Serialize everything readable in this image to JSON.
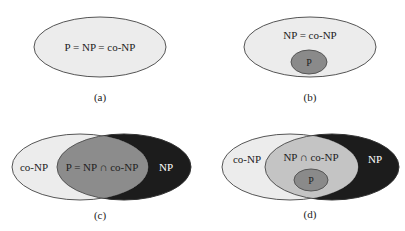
{
  "colors": {
    "background": "#ffffff",
    "light_fill": "#ececec",
    "mid_fill": "#8c8c8c",
    "inner_light_fill": "#c4c4c4",
    "dark_fill": "#1c1c1c",
    "p_fill": "#8a8a8a",
    "stroke": "#555555",
    "text": "#222222",
    "text_on_dark": "#ffffff"
  },
  "panels": [
    {
      "id": "a",
      "caption": "(a)",
      "labels": {
        "main": "P = NP = co-NP"
      }
    },
    {
      "id": "b",
      "caption": "(b)",
      "labels": {
        "outer": "NP = co-NP",
        "inner": "P"
      }
    },
    {
      "id": "c",
      "caption": "(c)",
      "labels": {
        "left": "co-NP",
        "middle": "P = NP ∩ co-NP",
        "right": "NP"
      }
    },
    {
      "id": "d",
      "caption": "(d)",
      "labels": {
        "left": "co-NP",
        "middle": "NP ∩ co-NP",
        "inner": "P",
        "right": "NP"
      }
    }
  ]
}
